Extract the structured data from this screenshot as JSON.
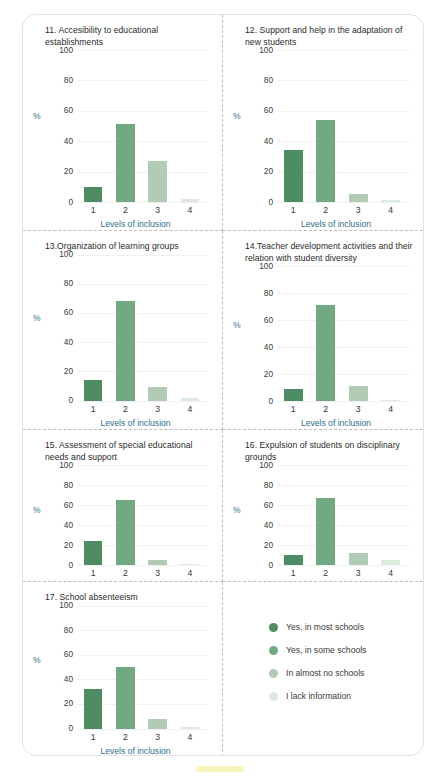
{
  "colors": {
    "level1": "#4e8c63",
    "level2": "#72a982",
    "level3": "#b2cbb4",
    "level4": "#dcebdd",
    "axis_label": "#2d6f8f",
    "title": "#2a2a2a",
    "gridline": "#f0f0f0",
    "card_border": "#e3e3e3",
    "divider": "#bdbdbd",
    "bottom_mark": "#f7f2a8"
  },
  "axis": {
    "y_label": "%",
    "y_ticks": [
      "100",
      "80",
      "60",
      "40",
      "20",
      "0"
    ],
    "x_ticks": [
      "1",
      "2",
      "3",
      "4"
    ],
    "x_title": "Levels of inclusion"
  },
  "legend": {
    "items": [
      {
        "label": "Yes, in most schools",
        "color": "#4e8c63"
      },
      {
        "label": "Yes, in some schools",
        "color": "#72a982"
      },
      {
        "label": "In almost no schools",
        "color": "#b2cbb4"
      },
      {
        "label": "I lack information",
        "color": "#dcebdd"
      }
    ]
  },
  "chart_data": [
    {
      "type": "bar",
      "title": "11. Accesibility to educational establishments",
      "categories": [
        "1",
        "2",
        "3",
        "4"
      ],
      "values": [
        10,
        51,
        27,
        2
      ],
      "series": [
        {
          "name": "Levels of inclusion",
          "values": [
            10,
            51,
            27,
            2
          ]
        }
      ],
      "xlabel": "Levels of inclusion",
      "ylabel": "%",
      "ylim": [
        0,
        100
      ],
      "grid": true,
      "show_xlabel": true
    },
    {
      "type": "bar",
      "title": "12. Support and help in the adaptation of new students",
      "categories": [
        "1",
        "2",
        "3",
        "4"
      ],
      "values": [
        34,
        54,
        5,
        1
      ],
      "series": [
        {
          "name": "Levels of inclusion",
          "values": [
            34,
            54,
            5,
            1
          ]
        }
      ],
      "xlabel": "Levels of inclusion",
      "ylabel": "%",
      "ylim": [
        0,
        100
      ],
      "grid": true,
      "show_xlabel": true
    },
    {
      "type": "bar",
      "title": "13.Organization of learning groups",
      "categories": [
        "1",
        "2",
        "3",
        "4"
      ],
      "values": [
        14,
        68,
        9,
        2
      ],
      "series": [
        {
          "name": "Levels of inclusion",
          "values": [
            14,
            68,
            9,
            2
          ]
        }
      ],
      "xlabel": "Levels of inclusion",
      "ylabel": "%",
      "ylim": [
        0,
        100
      ],
      "grid": true,
      "show_xlabel": true
    },
    {
      "type": "bar",
      "title": "14.Teacher development activities and their relation with student diversity",
      "categories": [
        "1",
        "2",
        "3",
        "4"
      ],
      "values": [
        9,
        71,
        11,
        1
      ],
      "series": [
        {
          "name": "Levels of inclusion",
          "values": [
            9,
            71,
            11,
            1
          ]
        }
      ],
      "xlabel": "Levels of inclusion",
      "ylabel": "%",
      "ylim": [
        0,
        100
      ],
      "grid": true,
      "show_xlabel": true
    },
    {
      "type": "bar",
      "title": "15. Assessment of special educational needs and support",
      "categories": [
        "1",
        "2",
        "3",
        "4"
      ],
      "values": [
        24,
        65,
        5,
        1
      ],
      "series": [
        {
          "name": "Levels of inclusion",
          "values": [
            24,
            65,
            5,
            1
          ]
        }
      ],
      "xlabel": "",
      "ylabel": "%",
      "ylim": [
        0,
        100
      ],
      "grid": true,
      "show_xlabel": false
    },
    {
      "type": "bar",
      "title": "16. Expulsion of students on disciplinary grounds",
      "categories": [
        "1",
        "2",
        "3",
        "4"
      ],
      "values": [
        10,
        67,
        12,
        5
      ],
      "series": [
        {
          "name": "Levels of inclusion",
          "values": [
            10,
            67,
            12,
            5
          ]
        }
      ],
      "xlabel": "",
      "ylabel": "%",
      "ylim": [
        0,
        100
      ],
      "grid": true,
      "show_xlabel": false
    },
    {
      "type": "bar",
      "title": "17. School absenteeism",
      "categories": [
        "1",
        "2",
        "3",
        "4"
      ],
      "values": [
        32,
        50,
        8,
        1
      ],
      "series": [
        {
          "name": "Levels of inclusion",
          "values": [
            32,
            50,
            8,
            1
          ]
        }
      ],
      "xlabel": "Levels of inclusion",
      "ylabel": "%",
      "ylim": [
        0,
        100
      ],
      "grid": true,
      "show_xlabel": true
    }
  ]
}
